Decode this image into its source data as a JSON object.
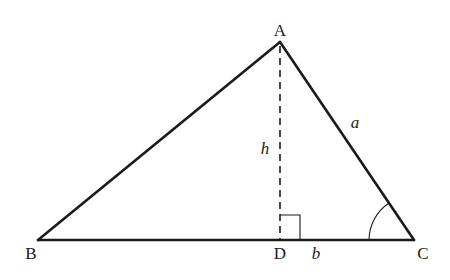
{
  "diagram": {
    "type": "triangle-with-altitude",
    "vertices": {
      "A": {
        "label": "A",
        "x": 280,
        "y": 42
      },
      "B": {
        "label": "B",
        "x": 38,
        "y": 240
      },
      "C": {
        "label": "C",
        "x": 414,
        "y": 240
      },
      "D": {
        "label": "D",
        "x": 280,
        "y": 240
      }
    },
    "labels": {
      "vertex_a": "A",
      "vertex_b": "B",
      "vertex_c": "C",
      "foot_d": "D",
      "altitude_h": "h",
      "side_a": "a",
      "segment_b": "b"
    },
    "annotations": {
      "right_angle_at": "D",
      "angle_marked_at": "C"
    },
    "colors": {
      "stroke": "#1a1a1a",
      "background": "#ffffff"
    }
  }
}
